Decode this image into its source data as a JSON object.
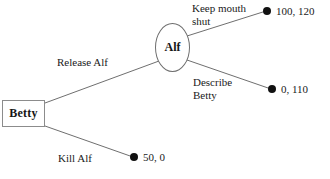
{
  "diagram": {
    "type": "game-tree",
    "colors": {
      "background": "#ffffff",
      "line": "#6f6f6f",
      "node_border": "#8c8c8c",
      "terminal": "#111111",
      "text": "#1a1a1a"
    },
    "nodes": [
      {
        "id": "betty",
        "label": "Betty",
        "shape": "rectangle",
        "player": "Betty"
      },
      {
        "id": "alf",
        "label": "Alf",
        "shape": "ellipse",
        "player": "Alf"
      }
    ],
    "edges": [
      {
        "id": "release-alf",
        "label": "Release Alf",
        "from": "betty",
        "to": "alf"
      },
      {
        "id": "kill-alf",
        "label": "Kill Alf",
        "from": "betty",
        "to": "terminal-kill"
      },
      {
        "id": "keep-mouth-shut",
        "label": "Keep mouth\nshut",
        "from": "alf",
        "to": "terminal-keep"
      },
      {
        "id": "describe-betty",
        "label": "Describe\nBetty",
        "from": "alf",
        "to": "terminal-describe"
      }
    ],
    "terminals": [
      {
        "id": "terminal-keep",
        "payoff": "100, 120"
      },
      {
        "id": "terminal-describe",
        "payoff": "0, 110"
      },
      {
        "id": "terminal-kill",
        "payoff": "50, 0"
      }
    ]
  }
}
